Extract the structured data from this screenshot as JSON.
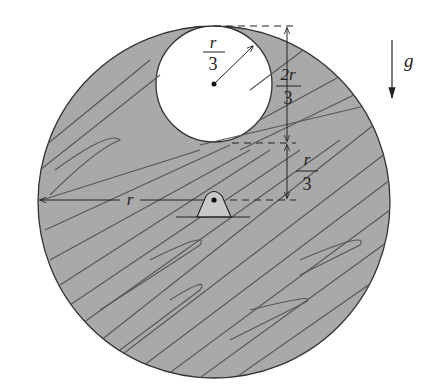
{
  "diagram": {
    "colors": {
      "disk_fill": "#a9a9a9",
      "grain": "#555555",
      "outline": "#333333",
      "hole_fill": "#ffffff",
      "pivot_fill": "#c8c8c8"
    },
    "labels": {
      "hole_radius_num": "r",
      "hole_radius_den": "3",
      "offset_num": "2r",
      "offset_den": "3",
      "gap_num": "r",
      "gap_den": "3",
      "disk_radius": "r",
      "gravity": "g"
    }
  }
}
